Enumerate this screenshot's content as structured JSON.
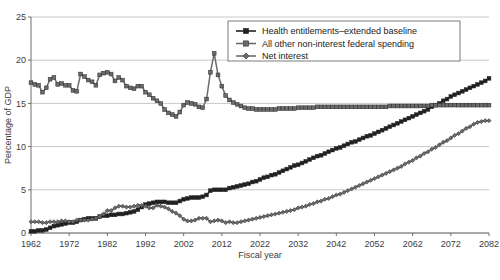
{
  "chart_data": {
    "type": "line",
    "title": "",
    "xlabel": "Fiscal year",
    "ylabel": "Percentage of GDP",
    "xlim": [
      1962,
      2082
    ],
    "ylim": [
      0,
      25
    ],
    "yticks": [
      0,
      5,
      10,
      15,
      20,
      25
    ],
    "xticks": [
      1962,
      1972,
      1982,
      1992,
      2002,
      2012,
      2022,
      2032,
      2042,
      2052,
      2062,
      2072,
      2082
    ],
    "grid": true,
    "legend_position": "top-right",
    "series": [
      {
        "name": "Health entitlements–extended baseline",
        "color": "#231f20",
        "marker": "square",
        "x": [
          1962,
          1963,
          1964,
          1965,
          1966,
          1967,
          1968,
          1969,
          1970,
          1971,
          1972,
          1973,
          1974,
          1975,
          1976,
          1977,
          1978,
          1979,
          1980,
          1981,
          1982,
          1983,
          1984,
          1985,
          1986,
          1987,
          1988,
          1989,
          1990,
          1991,
          1992,
          1993,
          1994,
          1995,
          1996,
          1997,
          1998,
          1999,
          2000,
          2001,
          2002,
          2003,
          2004,
          2005,
          2006,
          2007,
          2008,
          2009,
          2010,
          2011,
          2012,
          2013,
          2014,
          2015,
          2016,
          2017,
          2018,
          2019,
          2020,
          2021,
          2022,
          2023,
          2024,
          2025,
          2026,
          2027,
          2028,
          2029,
          2030,
          2031,
          2032,
          2033,
          2034,
          2035,
          2036,
          2037,
          2038,
          2039,
          2040,
          2041,
          2042,
          2043,
          2044,
          2045,
          2046,
          2047,
          2048,
          2049,
          2050,
          2051,
          2052,
          2053,
          2054,
          2055,
          2056,
          2057,
          2058,
          2059,
          2060,
          2061,
          2062,
          2063,
          2064,
          2065,
          2066,
          2067,
          2068,
          2069,
          2070,
          2071,
          2072,
          2073,
          2074,
          2075,
          2076,
          2077,
          2078,
          2079,
          2080,
          2081,
          2082
        ],
        "y": [
          0.2,
          0.2,
          0.3,
          0.3,
          0.4,
          0.6,
          0.8,
          0.9,
          1.0,
          1.1,
          1.2,
          1.2,
          1.3,
          1.5,
          1.6,
          1.7,
          1.7,
          1.7,
          1.9,
          2.0,
          2.0,
          2.1,
          2.1,
          2.2,
          2.2,
          2.3,
          2.4,
          2.5,
          2.7,
          3.0,
          3.3,
          3.4,
          3.5,
          3.6,
          3.6,
          3.6,
          3.5,
          3.5,
          3.5,
          3.7,
          3.9,
          4.0,
          4.1,
          4.1,
          4.1,
          4.2,
          4.4,
          4.9,
          5.0,
          5.0,
          5.0,
          5.0,
          5.2,
          5.3,
          5.4,
          5.5,
          5.6,
          5.7,
          5.9,
          6.0,
          6.2,
          6.4,
          6.5,
          6.7,
          6.8,
          7.0,
          7.2,
          7.4,
          7.6,
          7.8,
          7.9,
          8.1,
          8.3,
          8.5,
          8.7,
          8.9,
          9.0,
          9.2,
          9.4,
          9.6,
          9.8,
          9.9,
          10.1,
          10.3,
          10.5,
          10.6,
          10.8,
          11.0,
          11.2,
          11.3,
          11.5,
          11.7,
          11.9,
          12.1,
          12.3,
          12.5,
          12.7,
          12.9,
          13.1,
          13.3,
          13.5,
          13.7,
          13.9,
          14.1,
          14.3,
          14.6,
          14.8,
          15.0,
          15.3,
          15.5,
          15.8,
          16.0,
          16.2,
          16.4,
          16.6,
          16.8,
          17.0,
          17.2,
          17.4,
          17.6,
          17.9
        ]
      },
      {
        "name": "All other non-interest federal spending",
        "color": "#6b6b6b",
        "marker": "square",
        "x": [
          1962,
          1963,
          1964,
          1965,
          1966,
          1967,
          1968,
          1969,
          1970,
          1971,
          1972,
          1973,
          1974,
          1975,
          1976,
          1977,
          1978,
          1979,
          1980,
          1981,
          1982,
          1983,
          1984,
          1985,
          1986,
          1987,
          1988,
          1989,
          1990,
          1991,
          1992,
          1993,
          1994,
          1995,
          1996,
          1997,
          1998,
          1999,
          2000,
          2001,
          2002,
          2003,
          2004,
          2005,
          2006,
          2007,
          2008,
          2009,
          2010,
          2011,
          2012,
          2013,
          2014,
          2015,
          2016,
          2017,
          2018,
          2019,
          2020,
          2021,
          2022,
          2023,
          2024,
          2025,
          2026,
          2027,
          2028,
          2029,
          2030,
          2031,
          2032,
          2033,
          2034,
          2035,
          2036,
          2037,
          2038,
          2039,
          2040,
          2041,
          2042,
          2043,
          2044,
          2045,
          2046,
          2047,
          2048,
          2049,
          2050,
          2051,
          2052,
          2053,
          2054,
          2055,
          2056,
          2057,
          2058,
          2059,
          2060,
          2061,
          2062,
          2063,
          2064,
          2065,
          2066,
          2067,
          2068,
          2069,
          2070,
          2071,
          2072,
          2073,
          2074,
          2075,
          2076,
          2077,
          2078,
          2079,
          2080,
          2081,
          2082
        ],
        "y": [
          17.4,
          17.2,
          17.1,
          16.3,
          16.8,
          17.8,
          18.0,
          17.2,
          17.3,
          17.1,
          17.1,
          16.5,
          16.4,
          18.4,
          18.1,
          17.7,
          17.5,
          17.1,
          18.3,
          18.5,
          18.6,
          18.4,
          17.6,
          18.0,
          17.7,
          17.0,
          16.8,
          16.7,
          17.0,
          17.0,
          16.3,
          16.0,
          15.6,
          15.3,
          15.0,
          14.3,
          13.9,
          13.7,
          13.5,
          14.0,
          14.8,
          15.1,
          15.0,
          14.9,
          14.6,
          14.5,
          15.5,
          18.6,
          20.8,
          18.3,
          17.0,
          15.9,
          15.4,
          15.1,
          14.9,
          14.7,
          14.5,
          14.4,
          14.4,
          14.3,
          14.3,
          14.3,
          14.3,
          14.3,
          14.3,
          14.4,
          14.4,
          14.4,
          14.4,
          14.4,
          14.5,
          14.5,
          14.5,
          14.5,
          14.5,
          14.6,
          14.6,
          14.6,
          14.6,
          14.6,
          14.6,
          14.6,
          14.6,
          14.6,
          14.6,
          14.6,
          14.6,
          14.6,
          14.6,
          14.6,
          14.6,
          14.6,
          14.6,
          14.6,
          14.7,
          14.7,
          14.7,
          14.7,
          14.7,
          14.7,
          14.7,
          14.7,
          14.7,
          14.7,
          14.7,
          14.8,
          14.8,
          14.8,
          14.8,
          14.8,
          14.8,
          14.8,
          14.8,
          14.8,
          14.8,
          14.8,
          14.8,
          14.8,
          14.8,
          14.8,
          14.8
        ]
      },
      {
        "name": "Net interest",
        "color": "#6b6b6b",
        "marker": "diamond",
        "x": [
          1962,
          1963,
          1964,
          1965,
          1966,
          1967,
          1968,
          1969,
          1970,
          1971,
          1972,
          1973,
          1974,
          1975,
          1976,
          1977,
          1978,
          1979,
          1980,
          1981,
          1982,
          1983,
          1984,
          1985,
          1986,
          1987,
          1988,
          1989,
          1990,
          1991,
          1992,
          1993,
          1994,
          1995,
          1996,
          1997,
          1998,
          1999,
          2000,
          2001,
          2002,
          2003,
          2004,
          2005,
          2006,
          2007,
          2008,
          2009,
          2010,
          2011,
          2012,
          2013,
          2014,
          2015,
          2016,
          2017,
          2018,
          2019,
          2020,
          2021,
          2022,
          2023,
          2024,
          2025,
          2026,
          2027,
          2028,
          2029,
          2030,
          2031,
          2032,
          2033,
          2034,
          2035,
          2036,
          2037,
          2038,
          2039,
          2040,
          2041,
          2042,
          2043,
          2044,
          2045,
          2046,
          2047,
          2048,
          2049,
          2050,
          2051,
          2052,
          2053,
          2054,
          2055,
          2056,
          2057,
          2058,
          2059,
          2060,
          2061,
          2062,
          2063,
          2064,
          2065,
          2066,
          2067,
          2068,
          2069,
          2070,
          2071,
          2072,
          2073,
          2074,
          2075,
          2076,
          2077,
          2078,
          2079,
          2080,
          2081,
          2082
        ],
        "y": [
          1.3,
          1.3,
          1.3,
          1.2,
          1.2,
          1.3,
          1.3,
          1.3,
          1.4,
          1.4,
          1.3,
          1.3,
          1.5,
          1.5,
          1.5,
          1.5,
          1.6,
          1.7,
          1.9,
          2.2,
          2.6,
          2.6,
          2.9,
          3.1,
          3.1,
          3.0,
          3.0,
          3.1,
          3.2,
          3.2,
          3.1,
          2.9,
          2.9,
          3.2,
          3.1,
          3.0,
          2.8,
          2.5,
          2.3,
          2.0,
          1.6,
          1.4,
          1.4,
          1.5,
          1.7,
          1.7,
          1.7,
          1.3,
          1.4,
          1.5,
          1.4,
          1.2,
          1.3,
          1.2,
          1.2,
          1.3,
          1.4,
          1.5,
          1.6,
          1.7,
          1.8,
          1.9,
          2.0,
          2.1,
          2.2,
          2.3,
          2.4,
          2.5,
          2.6,
          2.7,
          2.9,
          3.0,
          3.1,
          3.3,
          3.4,
          3.6,
          3.7,
          3.9,
          4.0,
          4.2,
          4.4,
          4.5,
          4.7,
          4.9,
          5.1,
          5.3,
          5.5,
          5.7,
          5.9,
          6.1,
          6.3,
          6.5,
          6.7,
          6.9,
          7.1,
          7.3,
          7.5,
          7.7,
          8.0,
          8.2,
          8.4,
          8.7,
          8.9,
          9.2,
          9.4,
          9.7,
          9.9,
          10.2,
          10.5,
          10.7,
          11.0,
          11.3,
          11.5,
          11.8,
          12.1,
          12.3,
          12.6,
          12.8,
          12.9,
          13.0,
          13.0
        ]
      }
    ]
  },
  "legend": {
    "entries": [
      {
        "label": "Health entitlements–extended baseline"
      },
      {
        "label": "All other non-interest federal spending"
      },
      {
        "label": "Net interest"
      }
    ]
  },
  "axes": {
    "y_title": "Percentage of GDP",
    "x_title": "Fiscal year",
    "y_tick_labels": [
      "0",
      "5",
      "10",
      "15",
      "20",
      "25"
    ],
    "x_tick_labels": [
      "1962",
      "1972",
      "1982",
      "1992",
      "2002",
      "2012",
      "2022",
      "2032",
      "2042",
      "2052",
      "2062",
      "2072",
      "2082"
    ]
  }
}
